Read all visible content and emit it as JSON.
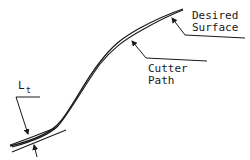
{
  "diagram": {
    "labels": {
      "desired_surface_line1": "Desired",
      "desired_surface_line2": "Surface",
      "cutter_path_line1": "Cutter",
      "cutter_path_line2": "Path",
      "tolerance_main": "L",
      "tolerance_sub": "t"
    },
    "elements": [
      {
        "id": "desired-surface-curve",
        "kind": "curve"
      },
      {
        "id": "cutter-path-curve",
        "kind": "curve"
      },
      {
        "id": "tangent-line",
        "kind": "line"
      },
      {
        "id": "tolerance-arrows",
        "kind": "arrow-pair"
      }
    ],
    "colors": {
      "ink": "#1a1a1a",
      "background": "#ffffff"
    }
  }
}
